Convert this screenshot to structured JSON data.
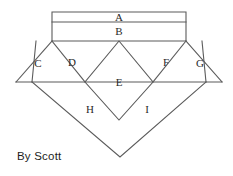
{
  "figure": {
    "background_color": "#ffffff",
    "line_color": "#5b5b5b",
    "face_color": "#ffffff",
    "label_color": "#2a2a2a"
  },
  "credit": {
    "text": "By Scott"
  },
  "regions": [
    {
      "id": "A",
      "label": "A",
      "shape": "rectangle",
      "label_x": 119,
      "label_y": 18
    },
    {
      "id": "B",
      "label": "B",
      "shape": "rectangle",
      "label_x": 119,
      "label_y": 32
    },
    {
      "id": "C",
      "label": "C",
      "shape": "parallelogram",
      "label_x": 38,
      "label_y": 64
    },
    {
      "id": "D",
      "label": "D",
      "shape": "parallelogram",
      "label_x": 72,
      "label_y": 63
    },
    {
      "id": "E",
      "label": "E",
      "shape": "rhombus",
      "label_x": 119,
      "label_y": 83
    },
    {
      "id": "F",
      "label": "F",
      "shape": "parallelogram",
      "label_x": 166,
      "label_y": 63
    },
    {
      "id": "G",
      "label": "G",
      "shape": "parallelogram",
      "label_x": 200,
      "label_y": 64
    },
    {
      "id": "H",
      "label": "H",
      "shape": "triangle",
      "label_x": 90,
      "label_y": 110
    },
    {
      "id": "I",
      "label": "I",
      "shape": "triangle",
      "label_x": 147,
      "label_y": 110
    }
  ],
  "geometry": {
    "faces": {
      "A": "52,12 186,12 186,22 52,22",
      "B": "52,22 186,22 186,41 52,41",
      "C": "16,82 32,82 52,41 36,41",
      "D": "32,82 85,82 119,41 52,41",
      "E": "85,82 119,41 153,82 119,120",
      "F": "153,82 186,41 202,41 206,82",
      "G": "206,82 202,41 222,41 222,82",
      "H": "32,82 85,82 119,120 120,157",
      "I": "153,82 206,82 120,157 119,120"
    },
    "edges": [
      "M52,12 L186,12 L186,41 L52,41 Z",
      "M52,22 L186,22",
      "M16,82 L52,41",
      "M32,82 L36,41",
      "M16,82 L222,82",
      "M52,41 L85,82",
      "M186,41 L153,82",
      "M119,41 L85,82 L119,120 L153,82 Z",
      "M202,41 L206,82",
      "M222,82 L186,41",
      "M32,82 L120,157 L206,82"
    ]
  }
}
